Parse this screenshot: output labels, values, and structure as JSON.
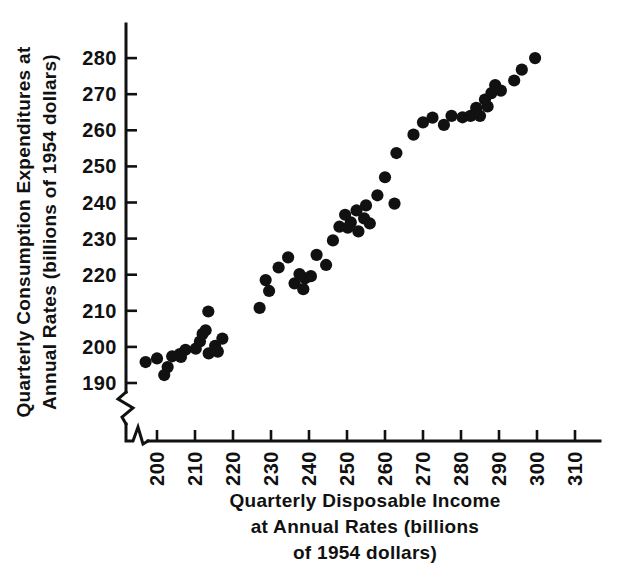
{
  "chart_data": {
    "type": "scatter",
    "title": "",
    "xlabel": "Quarterly Disposable Income at Annual Rates (billions of 1954 dollars)",
    "ylabel": "Quarterly Consumption Expenditures at Annual Rates (billions of 1954 dollars)",
    "xlim": [
      195,
      310
    ],
    "ylim": [
      186,
      284
    ],
    "xticks": [
      200,
      210,
      220,
      230,
      240,
      250,
      260,
      270,
      280,
      290,
      300,
      310
    ],
    "yticks": [
      190,
      200,
      210,
      220,
      230,
      240,
      250,
      260,
      270,
      280
    ],
    "grid": false,
    "legend": null,
    "axis_break_x": true,
    "axis_break_y": true,
    "marker_color": "#111111",
    "marker": "filled-circle",
    "points": [
      {
        "x": 197.0,
        "y": 195.8
      },
      {
        "x": 200.0,
        "y": 196.8
      },
      {
        "x": 201.9,
        "y": 192.2
      },
      {
        "x": 202.8,
        "y": 194.4
      },
      {
        "x": 204.0,
        "y": 197.4
      },
      {
        "x": 206.0,
        "y": 198.0
      },
      {
        "x": 206.3,
        "y": 197.2
      },
      {
        "x": 207.5,
        "y": 199.2
      },
      {
        "x": 210.2,
        "y": 199.5
      },
      {
        "x": 211.3,
        "y": 201.5
      },
      {
        "x": 212.0,
        "y": 203.6
      },
      {
        "x": 212.8,
        "y": 204.6
      },
      {
        "x": 213.5,
        "y": 209.8
      },
      {
        "x": 213.6,
        "y": 198.2
      },
      {
        "x": 215.3,
        "y": 200.3
      },
      {
        "x": 216.0,
        "y": 198.7
      },
      {
        "x": 217.2,
        "y": 202.3
      },
      {
        "x": 227.0,
        "y": 210.8
      },
      {
        "x": 228.6,
        "y": 218.5
      },
      {
        "x": 229.5,
        "y": 215.5
      },
      {
        "x": 232.0,
        "y": 222.0
      },
      {
        "x": 234.5,
        "y": 224.8
      },
      {
        "x": 236.2,
        "y": 217.6
      },
      {
        "x": 237.5,
        "y": 220.2
      },
      {
        "x": 238.5,
        "y": 216.0
      },
      {
        "x": 239.0,
        "y": 219.0
      },
      {
        "x": 240.5,
        "y": 219.6
      },
      {
        "x": 242.0,
        "y": 225.5
      },
      {
        "x": 244.5,
        "y": 222.7
      },
      {
        "x": 246.3,
        "y": 229.5
      },
      {
        "x": 248.0,
        "y": 233.3
      },
      {
        "x": 249.5,
        "y": 236.6
      },
      {
        "x": 250.2,
        "y": 233.0
      },
      {
        "x": 251.0,
        "y": 234.5
      },
      {
        "x": 252.5,
        "y": 237.8
      },
      {
        "x": 253.0,
        "y": 232.0
      },
      {
        "x": 254.5,
        "y": 235.6
      },
      {
        "x": 255.0,
        "y": 239.2
      },
      {
        "x": 256.0,
        "y": 234.2
      },
      {
        "x": 258.0,
        "y": 242.0
      },
      {
        "x": 260.0,
        "y": 247.0
      },
      {
        "x": 262.5,
        "y": 239.7
      },
      {
        "x": 263.0,
        "y": 253.7
      },
      {
        "x": 267.5,
        "y": 258.8
      },
      {
        "x": 270.0,
        "y": 262.2
      },
      {
        "x": 272.5,
        "y": 263.5
      },
      {
        "x": 275.5,
        "y": 261.5
      },
      {
        "x": 277.5,
        "y": 264.0
      },
      {
        "x": 280.4,
        "y": 263.6
      },
      {
        "x": 282.5,
        "y": 264.0
      },
      {
        "x": 284.0,
        "y": 266.2
      },
      {
        "x": 285.0,
        "y": 264.0
      },
      {
        "x": 286.3,
        "y": 268.5
      },
      {
        "x": 287.0,
        "y": 266.6
      },
      {
        "x": 288.0,
        "y": 270.3
      },
      {
        "x": 289.0,
        "y": 272.5
      },
      {
        "x": 290.5,
        "y": 271.0
      },
      {
        "x": 294.0,
        "y": 273.8
      },
      {
        "x": 296.0,
        "y": 276.8
      },
      {
        "x": 299.5,
        "y": 280.0
      }
    ]
  },
  "axes": {
    "y_title_lines": [
      "Quarterly Consumption Expenditures at",
      "Annual Rates (billions of 1954 dollars)"
    ],
    "x_title_lines": [
      "Quarterly Disposable Income",
      "at Annual Rates (billions",
      "of 1954 dollars)"
    ],
    "y_tick_labels": [
      "280",
      "270",
      "260",
      "250",
      "240",
      "230",
      "220",
      "210",
      "200",
      "190"
    ],
    "x_tick_labels": [
      "200",
      "210",
      "220",
      "230",
      "240",
      "250",
      "260",
      "270",
      "280",
      "290",
      "300",
      "310"
    ]
  }
}
